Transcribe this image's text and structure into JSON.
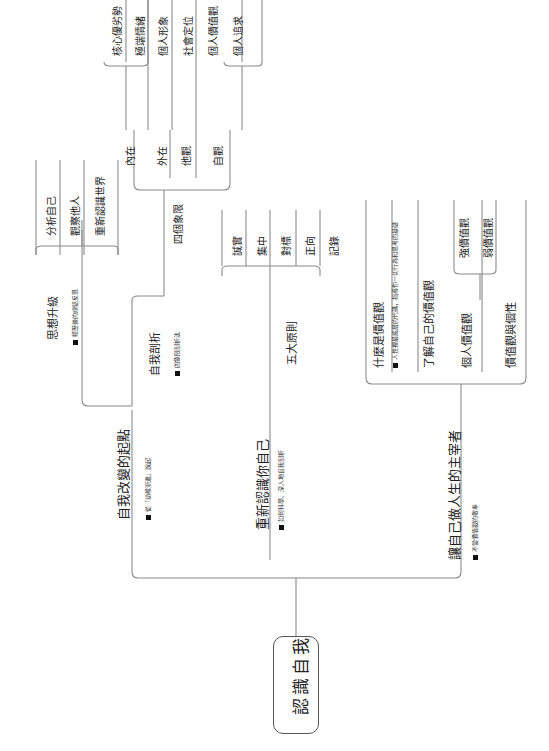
{
  "root": {
    "label": "認識自我"
  },
  "branches": [
    {
      "label": "自我改變的起點",
      "note": "從「幼稚漸進」說起",
      "children": [
        {
          "label": "思想升級",
          "note": "經歷後的總結反思",
          "children": [
            {
              "label": "分析自己"
            },
            {
              "label": "觀察他人"
            },
            {
              "label": "重新認識世界"
            }
          ]
        },
        {
          "label": "自我剖析",
          "note": "四象限剖析法",
          "children": [
            {
              "label": "四個象限",
              "children": [
                {
                  "label": "內在",
                  "children": [
                    {
                      "label": "核心優劣勢"
                    },
                    {
                      "label": "極端情緒"
                    }
                  ]
                },
                {
                  "label": "外在",
                  "children": [
                    {
                      "label": "個人形象"
                    }
                  ]
                },
                {
                  "label": "他觀",
                  "children": [
                    {
                      "label": "社會定位"
                    }
                  ]
                },
                {
                  "label": "自觀",
                  "children": [
                    {
                      "label": "個人價值觀"
                    },
                    {
                      "label": "個人追求"
                    }
                  ]
                }
              ]
            }
          ]
        }
      ]
    },
    {
      "label": "重新認識你自己",
      "note": "如何科學、深入地自我剖析",
      "children": [
        {
          "label": "五大原則",
          "children": [
            {
              "label": "誠實"
            },
            {
              "label": "集中"
            },
            {
              "label": "對標"
            },
            {
              "label": "正向"
            },
            {
              "label": "記錄"
            }
          ]
        }
      ]
    },
    {
      "label": "讓自己做人生的主宰者",
      "note": "不當價值觀的敬奉",
      "children": [
        {
          "label": "什麼是價值觀",
          "note": "人性裡最底層的代碼，指導你一切行為和思考的基礎"
        },
        {
          "label": "了解自己的價值觀"
        },
        {
          "label": "個人價值觀",
          "children": [
            {
              "label": "強價值觀"
            },
            {
              "label": "弱價值觀"
            }
          ]
        },
        {
          "label": "價值觀與個性"
        }
      ]
    }
  ],
  "colors": {
    "line": "#8a8a8a",
    "border": "#555555",
    "text": "#222222"
  }
}
